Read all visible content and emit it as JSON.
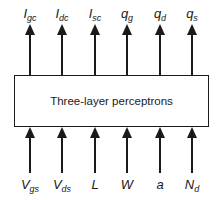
{
  "diagram": {
    "block_label": "Three-layer perceptrons",
    "outputs": [
      {
        "base": "I",
        "sub": "gc",
        "x": 30
      },
      {
        "base": "I",
        "sub": "dc",
        "x": 62
      },
      {
        "base": "I",
        "sub": "sc",
        "x": 95
      },
      {
        "base": "q",
        "sub": "g",
        "x": 127
      },
      {
        "base": "q",
        "sub": "d",
        "x": 160
      },
      {
        "base": "q",
        "sub": "s",
        "x": 192
      }
    ],
    "inputs": [
      {
        "base": "V",
        "sub": "gs",
        "x": 30
      },
      {
        "base": "V",
        "sub": "ds",
        "x": 62
      },
      {
        "base": "L",
        "sub": "",
        "x": 95
      },
      {
        "base": "W",
        "sub": "",
        "x": 127
      },
      {
        "base": "a",
        "sub": "",
        "x": 160
      },
      {
        "base": "N",
        "sub": "d",
        "x": 192
      }
    ],
    "line_color": "#1a1a1a"
  }
}
